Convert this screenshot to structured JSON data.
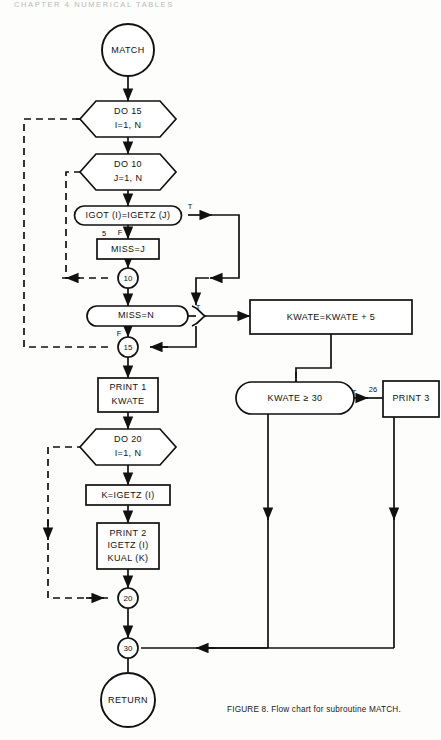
{
  "page": {
    "header": "CHAPTER 4   NUMERICAL TABLES",
    "caption": "FIGURE 8. Flow chart for subroutine MATCH."
  },
  "nodes": {
    "start": "MATCH",
    "do15": {
      "line1": "DO 15",
      "line2": "I=1, N"
    },
    "do10": {
      "line1": "DO 10",
      "line2": "J=1, N"
    },
    "igot": "IGOT (I)=IGETZ (J)",
    "missj": "MISS=J",
    "conn10": "10",
    "missn": "MISS=N",
    "conn15": "15",
    "print1": {
      "line1": "PRINT 1",
      "line2": "KWATE"
    },
    "do20": {
      "line1": "DO 20",
      "line2": "I=1, N"
    },
    "kigetz": "K=IGETZ (I)",
    "print2": {
      "line1": "PRINT 2",
      "line2": "IGETZ (I)",
      "line3": "KUAL (K)"
    },
    "conn20": "20",
    "conn30": "30",
    "ret": "RETURN",
    "kwateadd": "KWATE=KWATE + 5",
    "kwatecmp": "KWATE ≥ 30",
    "print3": "PRINT 3"
  },
  "labels": {
    "igot_true": "T",
    "igot_false": "F",
    "stmt5": "5",
    "missn_true": "T",
    "missn_false": "F",
    "cmp_true": "T",
    "stmt26": "26"
  },
  "colors": {
    "ink": "#111111",
    "paper": "#ffffff"
  }
}
